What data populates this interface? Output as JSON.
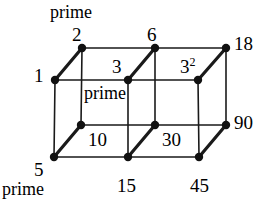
{
  "figure": {
    "background_color": "#ffffff",
    "line_color": "#1a1a1a",
    "node_color": "#111111",
    "thin_stroke": 1.6,
    "thick_stroke": 3.2,
    "node_radius": 4.2
  },
  "nodes": [
    {
      "id": "n2",
      "label": "2",
      "x": 82,
      "y": 48
    },
    {
      "id": "n6",
      "label": "6",
      "x": 155,
      "y": 48
    },
    {
      "id": "n18",
      "label": "18",
      "x": 226,
      "y": 48
    },
    {
      "id": "n1",
      "label": "1",
      "x": 55,
      "y": 80
    },
    {
      "id": "n3",
      "label": "3",
      "x": 128,
      "y": 80
    },
    {
      "id": "n9",
      "label": "3",
      "x": 198,
      "y": 80,
      "exponent": "2"
    },
    {
      "id": "n10",
      "label": "10",
      "x": 81,
      "y": 125
    },
    {
      "id": "n30",
      "label": "30",
      "x": 155,
      "y": 125
    },
    {
      "id": "n90",
      "label": "90",
      "x": 226,
      "y": 125
    },
    {
      "id": "n5",
      "label": "5",
      "x": 54,
      "y": 157
    },
    {
      "id": "n15",
      "label": "15",
      "x": 128,
      "y": 157
    },
    {
      "id": "n45",
      "label": "45",
      "x": 199,
      "y": 157
    }
  ],
  "edges": [
    {
      "from": "n2",
      "to": "n6",
      "style": "thin"
    },
    {
      "from": "n6",
      "to": "n18",
      "style": "thin"
    },
    {
      "from": "n1",
      "to": "n3",
      "style": "thin"
    },
    {
      "from": "n3",
      "to": "n9",
      "style": "thin"
    },
    {
      "from": "n10",
      "to": "n30",
      "style": "thin"
    },
    {
      "from": "n30",
      "to": "n90",
      "style": "thin"
    },
    {
      "from": "n5",
      "to": "n15",
      "style": "thin"
    },
    {
      "from": "n15",
      "to": "n45",
      "style": "thin"
    },
    {
      "from": "n2",
      "to": "n10",
      "style": "thin"
    },
    {
      "from": "n6",
      "to": "n30",
      "style": "thin"
    },
    {
      "from": "n18",
      "to": "n90",
      "style": "thin"
    },
    {
      "from": "n1",
      "to": "n5",
      "style": "thin"
    },
    {
      "from": "n3",
      "to": "n15",
      "style": "thin"
    },
    {
      "from": "n9",
      "to": "n45",
      "style": "thin"
    },
    {
      "from": "n1",
      "to": "n2",
      "style": "thick"
    },
    {
      "from": "n3",
      "to": "n6",
      "style": "thick"
    },
    {
      "from": "n9",
      "to": "n18",
      "style": "thick"
    },
    {
      "from": "n5",
      "to": "n10",
      "style": "thick"
    },
    {
      "from": "n15",
      "to": "n30",
      "style": "thick"
    },
    {
      "from": "n45",
      "to": "n90",
      "style": "thick"
    }
  ],
  "labels": [
    {
      "id": "lbl-prime-top",
      "text": "prime",
      "x": 50,
      "y": 3,
      "kind": "word",
      "anchor": "start"
    },
    {
      "id": "lbl-2",
      "text": "2",
      "x": 72,
      "y": 25,
      "kind": "num",
      "anchor": "start"
    },
    {
      "id": "lbl-6",
      "text": "6",
      "x": 147,
      "y": 25,
      "kind": "num",
      "anchor": "start"
    },
    {
      "id": "lbl-18",
      "text": "18",
      "x": 234,
      "y": 34,
      "kind": "num",
      "anchor": "start"
    },
    {
      "id": "lbl-1",
      "text": "1",
      "x": 34,
      "y": 66,
      "kind": "num",
      "anchor": "start"
    },
    {
      "id": "lbl-3",
      "text": "3",
      "x": 112,
      "y": 57,
      "kind": "num",
      "anchor": "start"
    },
    {
      "id": "lbl-9",
      "text": "3",
      "x": 180,
      "y": 57,
      "kind": "numsup",
      "sup": "2",
      "anchor": "start"
    },
    {
      "id": "lbl-prime-mid",
      "text": "prime",
      "x": 84,
      "y": 84,
      "kind": "word",
      "anchor": "start"
    },
    {
      "id": "lbl-10",
      "text": "10",
      "x": 88,
      "y": 130,
      "kind": "num",
      "anchor": "start"
    },
    {
      "id": "lbl-30",
      "text": "30",
      "x": 162,
      "y": 130,
      "kind": "num",
      "anchor": "start"
    },
    {
      "id": "lbl-90",
      "text": "90",
      "x": 234,
      "y": 113,
      "kind": "num",
      "anchor": "start"
    },
    {
      "id": "lbl-5",
      "text": "5",
      "x": 34,
      "y": 160,
      "kind": "num",
      "anchor": "start"
    },
    {
      "id": "lbl-prime-bot",
      "text": "prime",
      "x": 2,
      "y": 180,
      "kind": "word",
      "anchor": "start"
    },
    {
      "id": "lbl-15",
      "text": "15",
      "x": 117,
      "y": 176,
      "kind": "num",
      "anchor": "start"
    },
    {
      "id": "lbl-45",
      "text": "45",
      "x": 190,
      "y": 176,
      "kind": "num",
      "anchor": "start"
    }
  ],
  "chart_data": {
    "type": "diagram",
    "vertices": [
      "1",
      "2",
      "3",
      "3^2",
      "5",
      "6",
      "10",
      "15",
      "18",
      "30",
      "45",
      "90"
    ],
    "prime_annotations": [
      "2 prime",
      "3 prime",
      "5 prime"
    ]
  }
}
